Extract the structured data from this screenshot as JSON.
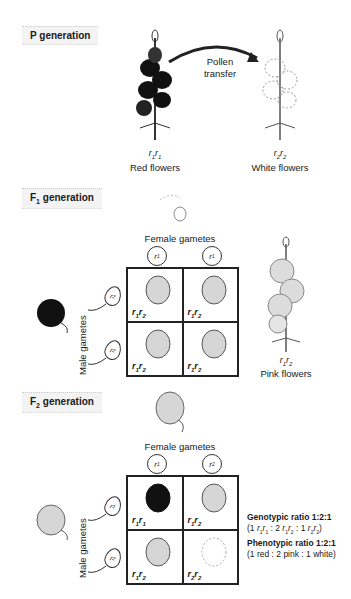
{
  "p_generation": {
    "label": "P generation",
    "arrow_label_line1": "Pollen",
    "arrow_label_line2": "transfer",
    "parents": [
      {
        "genotype_a": "r",
        "sub_a": "1",
        "genotype_b": "r",
        "sub_b": "1",
        "phenotype": "Red flowers",
        "color": "#111111"
      },
      {
        "genotype_a": "r",
        "sub_a": "2",
        "genotype_b": "r",
        "sub_b": "2",
        "phenotype": "White flowers",
        "color": "#ffffff"
      }
    ]
  },
  "f1_generation": {
    "label_main": "F",
    "label_sub": "1",
    "label_rest": " generation",
    "female_gametes_label": "Female gametes",
    "male_gametes_label": "Male gametes",
    "female_gametes": [
      {
        "a": "r",
        "sub": "1"
      },
      {
        "a": "r",
        "sub": "1"
      }
    ],
    "male_gametes": [
      {
        "a": "r",
        "sub": "2"
      },
      {
        "a": "r",
        "sub": "2"
      }
    ],
    "cells": [
      {
        "a": "r",
        "s1": "1",
        "b": "r",
        "s2": "2",
        "color": "#cfcfcf"
      },
      {
        "a": "r",
        "s1": "1",
        "b": "r",
        "s2": "2",
        "color": "#cfcfcf"
      },
      {
        "a": "r",
        "s1": "1",
        "b": "r",
        "s2": "2",
        "color": "#cfcfcf"
      },
      {
        "a": "r",
        "s1": "1",
        "b": "r",
        "s2": "2",
        "color": "#cfcfcf"
      }
    ],
    "offspring": {
      "a": "r",
      "s1": "1",
      "b": "r",
      "s2": "2",
      "phenotype": "Pink flowers"
    }
  },
  "f2_generation": {
    "label_main": "F",
    "label_sub": "2",
    "label_rest": " generation",
    "female_gametes_label": "Female gametes",
    "male_gametes_label": "Male gametes",
    "female_gametes": [
      {
        "a": "r",
        "sub": "1"
      },
      {
        "a": "r",
        "sub": "2"
      }
    ],
    "male_gametes": [
      {
        "a": "r",
        "sub": "1"
      },
      {
        "a": "r",
        "sub": "2"
      }
    ],
    "cells": [
      {
        "a": "r",
        "s1": "1",
        "b": "r",
        "s2": "1",
        "color": "#111111"
      },
      {
        "a": "r",
        "s1": "1",
        "b": "r",
        "s2": "2",
        "color": "#cfcfcf"
      },
      {
        "a": "r",
        "s1": "1",
        "b": "r",
        "s2": "2",
        "color": "#cfcfcf"
      },
      {
        "a": "r",
        "s1": "2",
        "b": "r",
        "s2": "2",
        "color": "#ffffff"
      }
    ],
    "genotypic_ratio_label": "Genotypic ratio 1:2:1",
    "genotypic_detail": {
      "open": "(1 ",
      "t1a": "r",
      "t1s1": "1",
      "t1b": "r",
      "t1s2": "1",
      "sep1": " : 2 ",
      "t2a": "r",
      "t2s1": "1",
      "t2b": "r",
      "t2s2": "2",
      "sep2": " : 1 ",
      "t3a": "r",
      "t3s1": "2",
      "t3b": "r",
      "t3s2": "2",
      "close": ")"
    },
    "phenotypic_ratio_label": "Phenotypic ratio 1:2:1",
    "phenotypic_detail": "(1 red : 2 pink : 1 white)"
  }
}
